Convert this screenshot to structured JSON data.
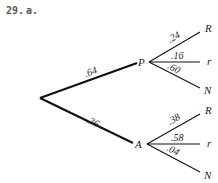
{
  "problem": {
    "number": "29.",
    "part": "a."
  },
  "tree": {
    "root": {
      "x": 40,
      "y": 98
    },
    "first_level": [
      {
        "label": "P",
        "prob": ".64",
        "node": {
          "x": 149,
          "y": 62
        },
        "children": [
          {
            "label": "R",
            "prob": ".24",
            "end": {
              "x": 200,
              "y": 31
            }
          },
          {
            "label": "r",
            "prob": ".16",
            "end": {
              "x": 202,
              "y": 62
            }
          },
          {
            "label": "N",
            "prob": ".60",
            "end": {
              "x": 200,
              "y": 88
            }
          }
        ]
      },
      {
        "label": "A",
        "prob": ".36",
        "node": {
          "x": 147,
          "y": 144
        },
        "children": [
          {
            "label": "R",
            "prob": ".38",
            "end": {
              "x": 200,
              "y": 114
            }
          },
          {
            "label": "r",
            "prob": ".58",
            "end": {
              "x": 202,
              "y": 144
            }
          },
          {
            "label": "N",
            "prob": ".04",
            "end": {
              "x": 200,
              "y": 172
            }
          }
        ]
      }
    ]
  },
  "colors": {
    "line": "#111111",
    "text": "#222222",
    "header": "#555555"
  }
}
